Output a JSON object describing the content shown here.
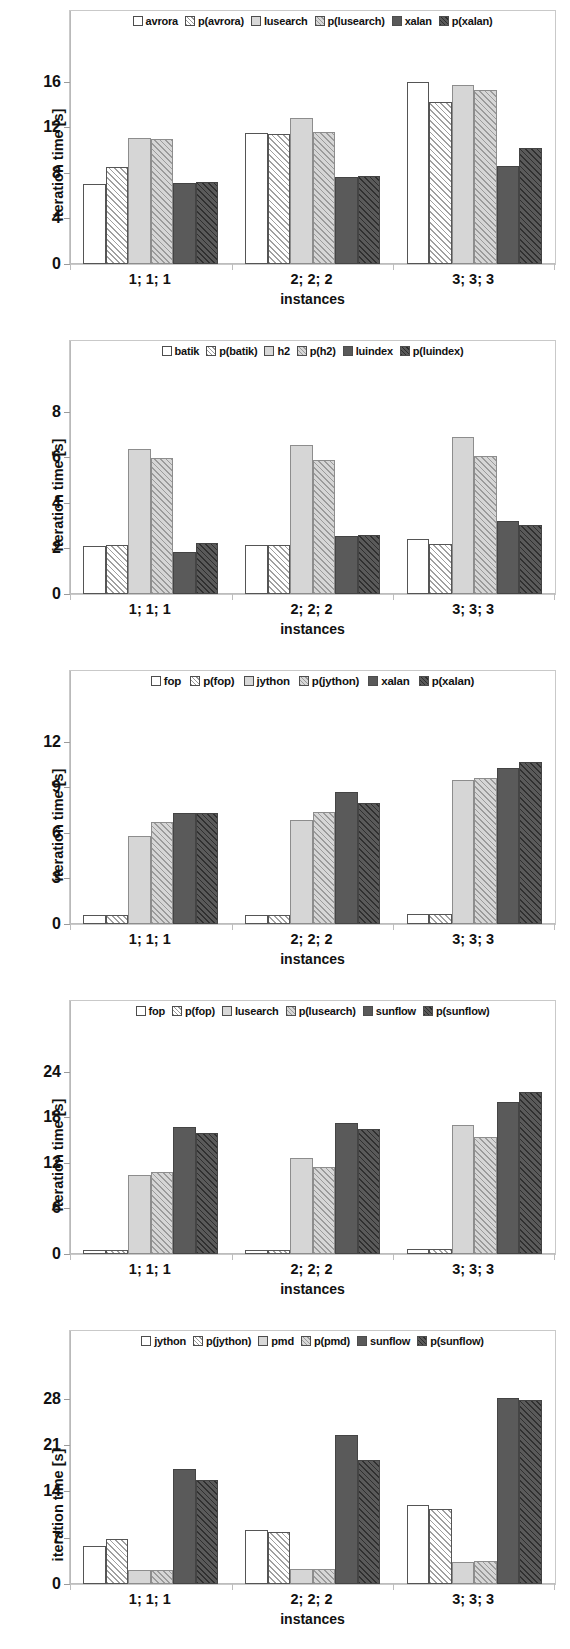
{
  "figure": {
    "axis_title_y": "iteration time [s]",
    "axis_title_x": "instances",
    "group_labels": [
      "1; 1; 1",
      "2; 2; 2",
      "3; 3; 3"
    ]
  },
  "chart_data": [
    {
      "type": "bar",
      "title": "",
      "xlabel": "instances",
      "ylabel": "iteration time [s]",
      "categories": [
        "1; 1; 1",
        "2; 2; 2",
        "3; 3; 3"
      ],
      "ylim": [
        0,
        18
      ],
      "yticks": [
        0,
        4,
        8,
        12,
        16
      ],
      "ytick_labels": [
        "0",
        "4",
        "8",
        "12",
        "16"
      ],
      "grid": false,
      "legend_position": "top-inside",
      "series": [
        {
          "name": "avrora",
          "style": "plain",
          "values": [
            7.0,
            11.5,
            16.0
          ]
        },
        {
          "name": "p(avrora)",
          "style": "hatch",
          "values": [
            8.5,
            11.4,
            14.2
          ]
        },
        {
          "name": "lusearch",
          "style": "lgray",
          "values": [
            11.1,
            12.8,
            15.7
          ]
        },
        {
          "name": "p(lusearch)",
          "style": "lgrayh",
          "values": [
            11.0,
            11.6,
            15.3
          ]
        },
        {
          "name": "xalan",
          "style": "dgray",
          "values": [
            7.1,
            7.6,
            8.6
          ]
        },
        {
          "name": "p(xalan)",
          "style": "dgrayh",
          "values": [
            7.2,
            7.7,
            10.2
          ]
        }
      ]
    },
    {
      "type": "bar",
      "title": "",
      "xlabel": "instances",
      "ylabel": "iteration time [s]",
      "categories": [
        "1; 1; 1",
        "2; 2; 2",
        "3; 3; 3"
      ],
      "ylim": [
        0,
        9
      ],
      "yticks": [
        0,
        2,
        4,
        6,
        8
      ],
      "ytick_labels": [
        "0",
        "2",
        "4",
        "6",
        "8"
      ],
      "grid": false,
      "legend_position": "top-inside",
      "series": [
        {
          "name": "batik",
          "style": "plain",
          "values": [
            2.1,
            2.15,
            2.4
          ]
        },
        {
          "name": "p(batik)",
          "style": "hatch",
          "values": [
            2.15,
            2.15,
            2.2
          ]
        },
        {
          "name": "h2",
          "style": "lgray",
          "values": [
            6.35,
            6.55,
            6.9
          ]
        },
        {
          "name": "p(h2)",
          "style": "lgrayh",
          "values": [
            5.95,
            5.9,
            6.05
          ]
        },
        {
          "name": "luindex",
          "style": "dgray",
          "values": [
            1.85,
            2.55,
            3.2
          ]
        },
        {
          "name": "p(luindex)",
          "style": "dgrayh",
          "values": [
            2.25,
            2.6,
            3.05
          ]
        }
      ]
    },
    {
      "type": "bar",
      "title": "",
      "xlabel": "instances",
      "ylabel": "iteration time [s]",
      "categories": [
        "1; 1; 1",
        "2; 2; 2",
        "3; 3; 3"
      ],
      "ylim": [
        0,
        13.5
      ],
      "yticks": [
        0,
        3,
        6,
        9,
        12
      ],
      "ytick_labels": [
        "0",
        "3",
        "6",
        "9",
        "12"
      ],
      "grid": false,
      "legend_position": "top-inside",
      "series": [
        {
          "name": "fop",
          "style": "plain",
          "values": [
            0.6,
            0.62,
            0.68
          ]
        },
        {
          "name": "p(fop)",
          "style": "hatch",
          "values": [
            0.6,
            0.62,
            0.68
          ]
        },
        {
          "name": "jython",
          "style": "lgray",
          "values": [
            5.8,
            6.85,
            9.5
          ]
        },
        {
          "name": "p(jython)",
          "style": "lgrayh",
          "values": [
            6.75,
            7.35,
            9.6
          ]
        },
        {
          "name": "xalan",
          "style": "dgray",
          "values": [
            7.3,
            8.7,
            10.3
          ]
        },
        {
          "name": "p(xalan)",
          "style": "dgrayh",
          "values": [
            7.3,
            8.0,
            10.7
          ]
        }
      ]
    },
    {
      "type": "bar",
      "title": "",
      "xlabel": "instances",
      "ylabel": "iteration time [s]",
      "categories": [
        "1; 1; 1",
        "2; 2; 2",
        "3; 3; 3"
      ],
      "ylim": [
        0,
        27
      ],
      "yticks": [
        0,
        6,
        12,
        18,
        24
      ],
      "ytick_labels": [
        "0",
        "6",
        "12",
        "18",
        "24"
      ],
      "grid": false,
      "legend_position": "top-inside",
      "series": [
        {
          "name": "fop",
          "style": "plain",
          "values": [
            0.5,
            0.5,
            0.6
          ]
        },
        {
          "name": "p(fop)",
          "style": "hatch",
          "values": [
            0.5,
            0.5,
            0.6
          ]
        },
        {
          "name": "lusearch",
          "style": "lgray",
          "values": [
            10.4,
            12.6,
            17.0
          ]
        },
        {
          "name": "p(lusearch)",
          "style": "lgrayh",
          "values": [
            10.8,
            11.5,
            15.4
          ]
        },
        {
          "name": "sunflow",
          "style": "dgray",
          "values": [
            16.7,
            17.2,
            20.0
          ]
        },
        {
          "name": "p(sunflow)",
          "style": "dgrayh",
          "values": [
            16.0,
            16.4,
            21.3
          ]
        }
      ]
    },
    {
      "type": "bar",
      "title": "",
      "xlabel": "instances",
      "ylabel": "iteration time [s]",
      "categories": [
        "1; 1; 1",
        "2; 2; 2",
        "3; 3; 3"
      ],
      "ylim": [
        0,
        31
      ],
      "yticks": [
        0,
        7,
        14,
        21,
        28
      ],
      "ytick_labels": [
        "0",
        "7",
        "14",
        "21",
        "28"
      ],
      "grid": false,
      "legend_position": "top-inside",
      "series": [
        {
          "name": "jython",
          "style": "plain",
          "values": [
            5.8,
            8.1,
            12.0
          ]
        },
        {
          "name": "p(jython)",
          "style": "hatch",
          "values": [
            6.8,
            7.9,
            11.4
          ]
        },
        {
          "name": "pmd",
          "style": "lgray",
          "values": [
            2.1,
            2.2,
            3.3
          ]
        },
        {
          "name": "p(pmd)",
          "style": "lgrayh",
          "values": [
            2.1,
            2.3,
            3.5
          ]
        },
        {
          "name": "sunflow",
          "style": "dgray",
          "values": [
            17.4,
            22.5,
            28.2
          ]
        },
        {
          "name": "p(sunflow)",
          "style": "dgrayh",
          "values": [
            15.8,
            18.7,
            27.8
          ]
        }
      ]
    }
  ]
}
